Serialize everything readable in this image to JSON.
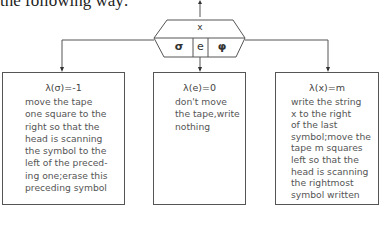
{
  "intro_text": "the following way:",
  "switch": {
    "input_label": "x",
    "symbols": [
      "σ",
      "e",
      "φ"
    ]
  },
  "boxes": [
    {
      "lambda": "λ(σ)=-1",
      "lines": [
        "move the tape",
        "one square to the",
        "right so that the",
        "head is scanning",
        "the symbol to the",
        "left of the preced-",
        "ing one;erase this",
        "preceding symbol"
      ]
    },
    {
      "lambda": "λ(e)=0",
      "lines": [
        "don't move",
        "the tape,write",
        "nothing"
      ]
    },
    {
      "lambda": "λ(x)=m",
      "lines": [
        "write the string",
        "x to the right",
        "of the last",
        "symbol;move the",
        "tape m squares",
        "left so that the",
        "head is scanning",
        "the rightmost",
        "symbol written"
      ]
    }
  ]
}
